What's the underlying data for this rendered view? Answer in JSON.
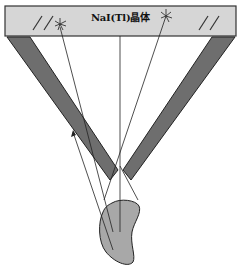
{
  "diagram": {
    "crystal_label": "NaI(Tl)晶体",
    "components": {
      "crystal": {
        "name": "NaI(Tl) crystal detector",
        "fill": "#d6d6d6",
        "stroke": "#333333"
      },
      "collimator": {
        "name": "converging collimator",
        "fill": "#6e6e6e",
        "stroke": "#222222"
      },
      "organ": {
        "name": "organ / source",
        "fill": "#a8a8a8",
        "stroke": "#222222"
      }
    },
    "marks": {
      "hatch_left": "double-slash-mark",
      "hatch_right": "double-slash-mark",
      "scintillation_left": "scintillation-flash",
      "scintillation_right": "scintillation-flash"
    },
    "rays": [
      {
        "name": "ray-center",
        "from": [
          120,
          232
        ],
        "to": [
          120,
          35
        ]
      },
      {
        "name": "ray-left-to-scintillation",
        "from": [
          112,
          222
        ],
        "to": [
          60,
          24
        ]
      },
      {
        "name": "ray-right-to-scintillation",
        "from": [
          104,
          198
        ],
        "to": [
          166,
          22
        ]
      },
      {
        "name": "ray-blocked-left",
        "from": [
          115,
          244
        ],
        "to": [
          74,
          130
        ]
      },
      {
        "name": "ray-right-lower",
        "from": [
          120,
          165
        ],
        "to": [
          138,
          198
        ]
      }
    ]
  }
}
